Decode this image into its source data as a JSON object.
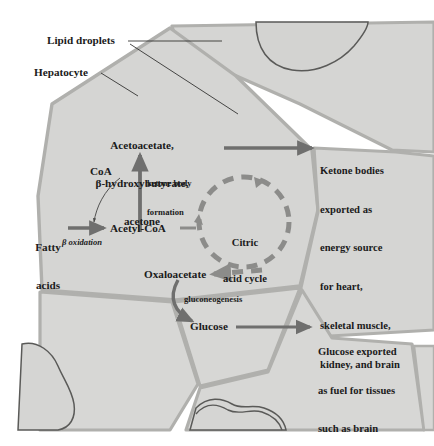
{
  "figure": {
    "background_color": "#ffffff",
    "cell_fill_color": "#d5d5d3",
    "cell_membrane_color": "#b0b0ad",
    "droplet_outline_color": "#5a5a58",
    "arrow_color": "#6f6f6e",
    "dashed_cycle_color": "#8c8c8a",
    "text_color": "#1b1b1b"
  },
  "callouts": {
    "lipid_droplets": "Lipid droplets",
    "hepatocyte": "Hepatocyte"
  },
  "metabolites": {
    "ketone_bodies_line1": "Acetoacetate,",
    "ketone_bodies_line2": "β-hydroxybutyrate,",
    "ketone_bodies_line3": "acetone",
    "coa": "CoA",
    "fatty_acids_line1": "Fatty",
    "fatty_acids_line2": "acids",
    "acetyl_coa": "Acetyl-CoA",
    "oxaloacetate": "Oxaloacetate",
    "glucose": "Glucose"
  },
  "processes": {
    "ketone_body_formation_line1": "ketone body",
    "ketone_body_formation_line2": "formation",
    "beta_oxidation": "β oxidation",
    "gluconeogenesis": "gluconeogenesis"
  },
  "cycle": {
    "line1": "Citric",
    "line2": "acid cycle"
  },
  "exports": {
    "ketone": [
      "Ketone bodies",
      "exported as",
      "energy source",
      "for heart,",
      "skeletal muscle,",
      "kidney, and brain"
    ],
    "glucose": [
      "Glucose exported",
      "as fuel for tissues",
      "such as brain"
    ]
  }
}
